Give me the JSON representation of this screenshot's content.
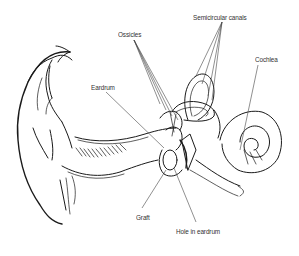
{
  "diagram": {
    "labels": [
      {
        "id": "ossicles",
        "text": "Ossicles",
        "x": 118,
        "y": 30
      },
      {
        "id": "semicircular_canals",
        "text": "Semicircular canals",
        "x": 193,
        "y": 13
      },
      {
        "id": "cochlea",
        "text": "Cochlea",
        "x": 255,
        "y": 55
      },
      {
        "id": "eardrum",
        "text": "Eardrum",
        "x": 91,
        "y": 83
      },
      {
        "id": "graft",
        "text": "Graft",
        "x": 136,
        "y": 213
      },
      {
        "id": "hole_in_eardrum",
        "text": "Hole in eardrum",
        "x": 176,
        "y": 227
      }
    ],
    "colors": {
      "background": "#ffffff",
      "line": "#1a1a1a",
      "label_text": "#333333"
    }
  }
}
